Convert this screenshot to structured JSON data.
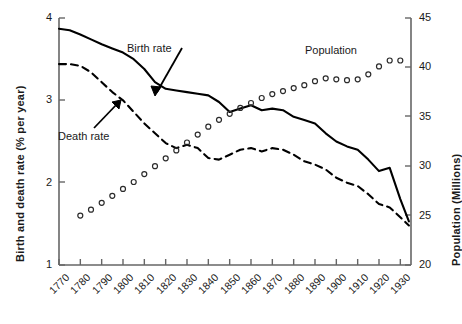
{
  "chart_data": {
    "type": "line",
    "title": "",
    "xlabel": "",
    "ylabel": "Birth and death rate (% per year)",
    "ylabel_right": "Population (Millions)",
    "xlim": [
      1770,
      1935
    ],
    "ylim": [
      1,
      4
    ],
    "ylim_right": [
      20,
      45
    ],
    "grid": false,
    "legend_position": "inline-annotations",
    "x_ticks": [
      1770,
      1780,
      1790,
      1800,
      1810,
      1820,
      1830,
      1840,
      1850,
      1860,
      1870,
      1880,
      1890,
      1900,
      1910,
      1920,
      1930
    ],
    "y_ticks_left": [
      1,
      2,
      3,
      4
    ],
    "y_ticks_right": [
      20,
      25,
      30,
      35,
      40,
      45
    ],
    "annotations": [
      {
        "text": "Birth rate",
        "target": "birth-rate-line"
      },
      {
        "text": "Death rate",
        "target": "death-rate-line"
      },
      {
        "text": "Population",
        "target": "population-points"
      }
    ],
    "series": [
      {
        "name": "Birth rate",
        "axis": "left",
        "style": "solid",
        "x": [
          1770,
          1775,
          1780,
          1785,
          1790,
          1795,
          1800,
          1805,
          1810,
          1815,
          1820,
          1825,
          1830,
          1835,
          1840,
          1845,
          1850,
          1855,
          1860,
          1865,
          1870,
          1875,
          1880,
          1885,
          1890,
          1895,
          1900,
          1905,
          1910,
          1915,
          1920,
          1925,
          1930,
          1934
        ],
        "y": [
          3.87,
          3.85,
          3.8,
          3.74,
          3.68,
          3.63,
          3.58,
          3.5,
          3.38,
          3.22,
          3.14,
          3.12,
          3.1,
          3.08,
          3.06,
          2.98,
          2.86,
          2.9,
          2.94,
          2.88,
          2.9,
          2.88,
          2.8,
          2.76,
          2.72,
          2.6,
          2.5,
          2.44,
          2.4,
          2.28,
          2.14,
          2.18,
          1.8,
          1.53
        ]
      },
      {
        "name": "Death rate",
        "axis": "left",
        "style": "dashed",
        "x": [
          1770,
          1775,
          1780,
          1785,
          1790,
          1795,
          1800,
          1805,
          1810,
          1815,
          1820,
          1825,
          1830,
          1835,
          1840,
          1845,
          1850,
          1855,
          1860,
          1865,
          1870,
          1875,
          1880,
          1885,
          1890,
          1895,
          1900,
          1905,
          1910,
          1915,
          1920,
          1925,
          1930,
          1934
        ],
        "y": [
          3.44,
          3.44,
          3.42,
          3.34,
          3.22,
          3.1,
          3.0,
          2.86,
          2.72,
          2.6,
          2.48,
          2.42,
          2.46,
          2.42,
          2.3,
          2.28,
          2.34,
          2.4,
          2.42,
          2.38,
          2.42,
          2.4,
          2.34,
          2.26,
          2.22,
          2.16,
          2.06,
          2.0,
          1.96,
          1.86,
          1.74,
          1.7,
          1.58,
          1.48
        ]
      },
      {
        "name": "Population",
        "axis": "right",
        "style": "open-circles",
        "x": [
          1780,
          1785,
          1790,
          1795,
          1800,
          1805,
          1810,
          1815,
          1820,
          1825,
          1830,
          1835,
          1840,
          1845,
          1850,
          1855,
          1860,
          1865,
          1870,
          1875,
          1880,
          1885,
          1890,
          1895,
          1900,
          1905,
          1910,
          1915,
          1920,
          1925,
          1930
        ],
        "y": [
          25.0,
          25.6,
          26.3,
          27.0,
          27.7,
          28.4,
          29.2,
          30.0,
          30.8,
          31.6,
          32.4,
          33.2,
          34.0,
          34.7,
          35.3,
          35.9,
          36.4,
          36.9,
          37.3,
          37.6,
          37.9,
          38.2,
          38.6,
          38.9,
          38.8,
          38.7,
          38.8,
          39.3,
          40.1,
          40.7,
          40.7
        ]
      }
    ]
  }
}
